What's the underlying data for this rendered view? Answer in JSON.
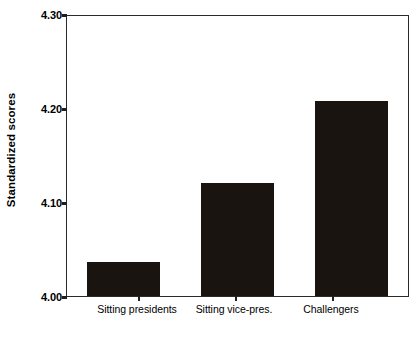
{
  "chart_data": {
    "type": "bar",
    "title": "",
    "subtitle": "",
    "xlabel": "",
    "ylabel": "Standardized scores",
    "categories": [
      "Sitting presidents",
      "Sitting vice-pres.",
      "Challengers"
    ],
    "values": [
      4.036,
      4.121,
      4.209
    ],
    "ylim": [
      4.0,
      4.3
    ],
    "y_ticks": [
      4.0,
      4.1,
      4.2,
      4.3
    ],
    "y_tick_labels": [
      "4.00",
      "4.10",
      "4.20",
      "4.30"
    ],
    "grid": false,
    "legend": null,
    "bar_color": "#1a1410",
    "axis_color": "#2a2a2a",
    "background_color": "#ffffff",
    "series": [
      {
        "name": "Standardized scores",
        "values": [
          4.036,
          4.121,
          4.209
        ]
      }
    ],
    "annotations": []
  },
  "axis": {
    "y_title": "Standardized scores",
    "y_labels": {
      "t0": "4.00",
      "t1": "4.10",
      "t2": "4.20",
      "t3": "4.30"
    },
    "x_labels": {
      "c0": "Sitting presidents",
      "c1": "Sitting vice-pres.",
      "c2": "Challengers"
    }
  }
}
